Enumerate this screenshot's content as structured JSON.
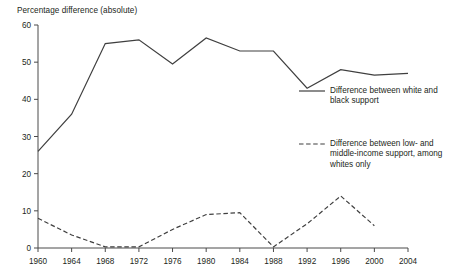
{
  "chart_data": {
    "type": "line",
    "title": "Percentage difference (absolute)",
    "xlabel": "",
    "ylabel": "Percentage difference (absolute)",
    "xlim": [
      1960,
      2004
    ],
    "ylim": [
      0,
      60
    ],
    "grid": false,
    "legend_position": "right",
    "x": [
      1960,
      1964,
      1968,
      1972,
      1976,
      1980,
      1984,
      1988,
      1992,
      1996,
      2000,
      2004
    ],
    "xticklabels": [
      "1960",
      "1964",
      "1968",
      "1972",
      "1976",
      "1980",
      "1984",
      "1988",
      "1992",
      "1996",
      "2000",
      "2004"
    ],
    "yticks": [
      0,
      10,
      20,
      30,
      40,
      50,
      60
    ],
    "yticklabels": [
      "0",
      "10",
      "20",
      "30",
      "40",
      "50",
      "60"
    ],
    "series": [
      {
        "name": "Difference between white and black support",
        "style": "solid",
        "color": "#3f3f3f",
        "x": [
          1960,
          1964,
          1968,
          1972,
          1976,
          1980,
          1984,
          1988,
          1992,
          1996,
          2000,
          2004
        ],
        "values": [
          26,
          36,
          55,
          56,
          49.5,
          56.5,
          53,
          53,
          43,
          48,
          46.5,
          47
        ]
      },
      {
        "name": "Difference between low- and middle-income support, among whites only",
        "style": "dashed",
        "color": "#3f3f3f",
        "x": [
          1960,
          1964,
          1968,
          1972,
          1976,
          1980,
          1984,
          1988,
          1992,
          1996,
          2000
        ],
        "values": [
          8,
          3.5,
          0.3,
          0.3,
          5,
          9,
          9.5,
          0.3,
          6.5,
          14,
          6
        ]
      }
    ]
  },
  "legend": {
    "solid_label": "Difference between white and black support",
    "dashed_label": "Difference between low- and middle-income support, among whites only"
  }
}
